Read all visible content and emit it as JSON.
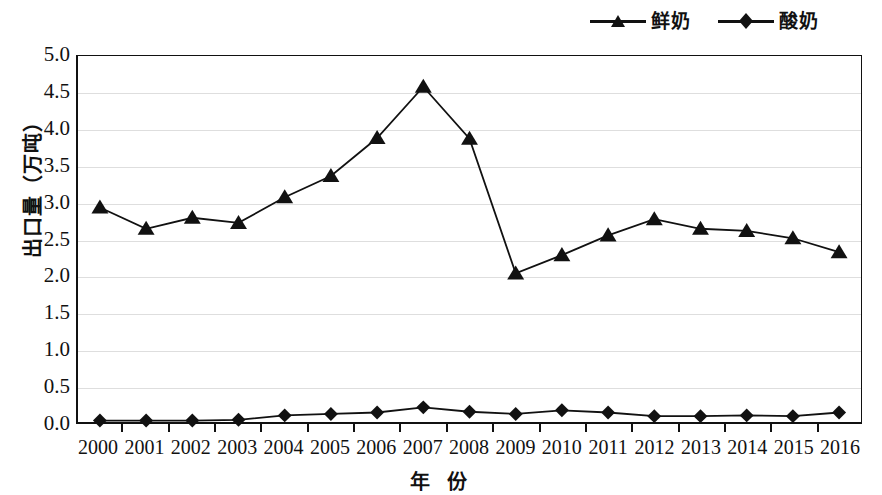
{
  "chart_data": {
    "type": "line",
    "title": "",
    "xlabel": "年  份",
    "ylabel": "出口量（万吨）",
    "categories": [
      "2000",
      "2001",
      "2002",
      "2003",
      "2004",
      "2005",
      "2006",
      "2007",
      "2008",
      "2009",
      "2010",
      "2011",
      "2012",
      "2013",
      "2014",
      "2015",
      "2016"
    ],
    "ylim": [
      0.0,
      5.0
    ],
    "ytick_labels": [
      "5.0",
      "4.5",
      "4.0",
      "3.5",
      "3.0",
      "2.5",
      "2.0",
      "1.5",
      "1.0",
      "0.5",
      "0.0"
    ],
    "ytick_values": [
      5.0,
      4.5,
      4.0,
      3.5,
      3.0,
      2.5,
      2.0,
      1.5,
      1.0,
      0.5,
      0.0
    ],
    "grid": true,
    "legend_position": "top-right",
    "series": [
      {
        "name": "鲜奶",
        "marker": "triangle",
        "color": "#111111",
        "values": [
          2.93,
          2.64,
          2.79,
          2.72,
          3.07,
          3.36,
          3.88,
          4.58,
          3.87,
          2.03,
          2.28,
          2.55,
          2.77,
          2.64,
          2.61,
          2.51,
          2.32
        ]
      },
      {
        "name": "酸奶",
        "marker": "diamond",
        "color": "#111111",
        "values": [
          0.02,
          0.02,
          0.02,
          0.03,
          0.09,
          0.11,
          0.13,
          0.2,
          0.14,
          0.11,
          0.16,
          0.13,
          0.08,
          0.08,
          0.09,
          0.08,
          0.13
        ]
      }
    ]
  },
  "legend": {
    "entries": [
      {
        "label": "鲜奶",
        "marker": "triangle-marker-icon"
      },
      {
        "label": "酸奶",
        "marker": "diamond-marker-icon"
      }
    ]
  }
}
